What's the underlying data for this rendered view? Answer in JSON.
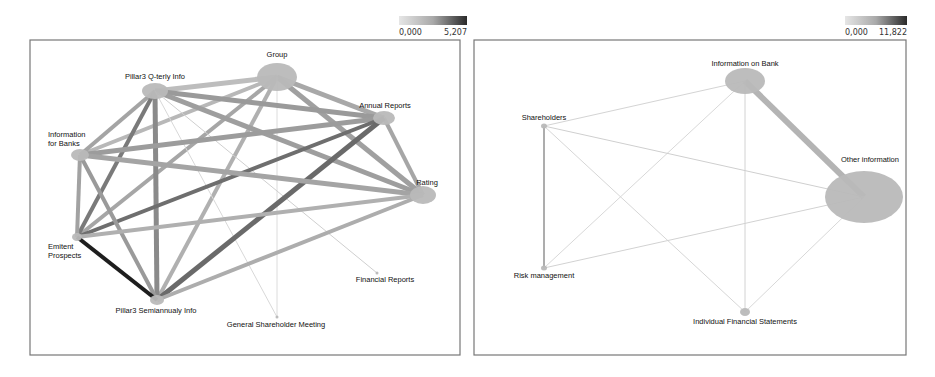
{
  "panels": [
    {
      "id": "left",
      "frame": {
        "x": 30,
        "y": 40,
        "w": 430,
        "h": 315
      },
      "scale": {
        "min_label": "0,000",
        "max_label": "5,207",
        "x": 399,
        "y": 16,
        "w": 68,
        "h": 9
      },
      "nodes": [
        {
          "id": "group",
          "label": "Group",
          "x": 277,
          "y": 77,
          "rx": 20,
          "ry": 14,
          "lx": 277,
          "ly": 57,
          "anchor": "middle"
        },
        {
          "id": "pillar3q",
          "label": "Pillar3 Q-terly Info",
          "x": 155,
          "y": 91,
          "rx": 13,
          "ry": 8,
          "lx": 155,
          "ly": 79,
          "anchor": "middle"
        },
        {
          "id": "annual",
          "label": "Annual Reports",
          "x": 384,
          "y": 118,
          "rx": 11,
          "ry": 7,
          "lx": 385,
          "ly": 108,
          "anchor": "middle"
        },
        {
          "id": "infobanks",
          "label": "Information",
          "label2": "for Banks",
          "x": 80,
          "y": 155,
          "rx": 9,
          "ry": 6,
          "lx": 48,
          "ly": 137,
          "anchor": "start"
        },
        {
          "id": "rating",
          "label": "Rating",
          "x": 423,
          "y": 195,
          "rx": 13,
          "ry": 9,
          "lx": 427,
          "ly": 185,
          "anchor": "middle"
        },
        {
          "id": "emitent",
          "label": "Emitent",
          "label2": "Prospects",
          "x": 77,
          "y": 237,
          "rx": 5,
          "ry": 4,
          "lx": 48,
          "ly": 249,
          "anchor": "start"
        },
        {
          "id": "pillar3s",
          "label": "Pillar3 Semiannualy Info",
          "x": 157,
          "y": 300,
          "rx": 7,
          "ry": 5,
          "lx": 156,
          "ly": 313,
          "anchor": "middle"
        },
        {
          "id": "financial",
          "label": "Financial Reports",
          "x": 377,
          "y": 273,
          "rx": 1.5,
          "ry": 1.5,
          "lx": 385,
          "ly": 282,
          "anchor": "middle"
        },
        {
          "id": "gsm",
          "label": "General Shareholder Meeting",
          "x": 277,
          "y": 317,
          "rx": 1.5,
          "ry": 1.5,
          "lx": 276,
          "ly": 327,
          "anchor": "middle"
        }
      ],
      "edges": [
        {
          "a": "group",
          "b": "pillar3q",
          "w": 5,
          "c": "#bdbdbd"
        },
        {
          "a": "group",
          "b": "annual",
          "w": 5,
          "c": "#a8a8a8"
        },
        {
          "a": "group",
          "b": "rating",
          "w": 5,
          "c": "#a0a0a0"
        },
        {
          "a": "group",
          "b": "infobanks",
          "w": 4,
          "c": "#b8b8b8"
        },
        {
          "a": "group",
          "b": "emitent",
          "w": 4,
          "c": "#a6a6a6"
        },
        {
          "a": "group",
          "b": "pillar3s",
          "w": 4,
          "c": "#b0b0b0"
        },
        {
          "a": "group",
          "b": "gsm",
          "w": 1,
          "c": "#dcdcdc"
        },
        {
          "a": "pillar3q",
          "b": "annual",
          "w": 5,
          "c": "#9a9a9a"
        },
        {
          "a": "pillar3q",
          "b": "rating",
          "w": 5,
          "c": "#9e9e9e"
        },
        {
          "a": "pillar3q",
          "b": "infobanks",
          "w": 4,
          "c": "#a4a4a4"
        },
        {
          "a": "pillar3q",
          "b": "emitent",
          "w": 4,
          "c": "#7a7a7a"
        },
        {
          "a": "pillar3q",
          "b": "pillar3s",
          "w": 5,
          "c": "#8a8a8a"
        },
        {
          "a": "pillar3q",
          "b": "financial",
          "w": 1,
          "c": "#cfcfcf"
        },
        {
          "a": "pillar3q",
          "b": "gsm",
          "w": 1,
          "c": "#d8d8d8"
        },
        {
          "a": "annual",
          "b": "rating",
          "w": 4,
          "c": "#a6a6a6"
        },
        {
          "a": "annual",
          "b": "infobanks",
          "w": 5,
          "c": "#9c9c9c"
        },
        {
          "a": "annual",
          "b": "emitent",
          "w": 4,
          "c": "#6e6e6e"
        },
        {
          "a": "annual",
          "b": "pillar3s",
          "w": 5,
          "c": "#6a6a6a"
        },
        {
          "a": "infobanks",
          "b": "rating",
          "w": 5,
          "c": "#a4a4a4"
        },
        {
          "a": "infobanks",
          "b": "emitent",
          "w": 4,
          "c": "#a2a2a2"
        },
        {
          "a": "infobanks",
          "b": "pillar3s",
          "w": 4,
          "c": "#9a9a9a"
        },
        {
          "a": "rating",
          "b": "emitent",
          "w": 4,
          "c": "#b0b0b0"
        },
        {
          "a": "rating",
          "b": "pillar3s",
          "w": 4,
          "c": "#adadad"
        },
        {
          "a": "emitent",
          "b": "pillar3s",
          "w": 4,
          "c": "#1e1e1e"
        }
      ]
    },
    {
      "id": "right",
      "frame": {
        "x": 474,
        "y": 40,
        "w": 432,
        "h": 315
      },
      "scale": {
        "min_label": "0,000",
        "max_label": "11,822",
        "x": 845,
        "y": 16,
        "w": 62,
        "h": 9
      },
      "nodes": [
        {
          "id": "infobank",
          "label": "Information on Bank",
          "x": 745,
          "y": 81,
          "rx": 20,
          "ry": 13,
          "lx": 745,
          "ly": 66,
          "anchor": "middle"
        },
        {
          "id": "shareholders",
          "label": "Shareholders",
          "x": 544,
          "y": 126,
          "rx": 3,
          "ry": 2.5,
          "lx": 544,
          "ly": 120,
          "anchor": "middle"
        },
        {
          "id": "other",
          "label": "Other information",
          "x": 864,
          "y": 197,
          "rx": 39,
          "ry": 26,
          "lx": 870,
          "ly": 162,
          "anchor": "middle"
        },
        {
          "id": "risk",
          "label": "Risk management",
          "x": 544,
          "y": 268,
          "rx": 3,
          "ry": 2.5,
          "lx": 544,
          "ly": 278,
          "anchor": "middle"
        },
        {
          "id": "ifs",
          "label": "Individual Financial Statements",
          "x": 745,
          "y": 312,
          "rx": 5,
          "ry": 4,
          "lx": 745,
          "ly": 324,
          "anchor": "middle"
        }
      ],
      "edges": [
        {
          "a": "infobank",
          "b": "other",
          "w": 6,
          "c": "#b4b4b4"
        },
        {
          "a": "shareholders",
          "b": "risk",
          "w": 1.4,
          "c": "#8a8a8a"
        },
        {
          "a": "infobank",
          "b": "shareholders",
          "w": 1,
          "c": "#d4d4d4"
        },
        {
          "a": "infobank",
          "b": "risk",
          "w": 1,
          "c": "#d8d8d8"
        },
        {
          "a": "infobank",
          "b": "ifs",
          "w": 1,
          "c": "#d2d2d2"
        },
        {
          "a": "shareholders",
          "b": "other",
          "w": 1,
          "c": "#cfcfcf"
        },
        {
          "a": "shareholders",
          "b": "ifs",
          "w": 1,
          "c": "#d6d6d6"
        },
        {
          "a": "risk",
          "b": "other",
          "w": 1,
          "c": "#d2d2d2"
        },
        {
          "a": "other",
          "b": "ifs",
          "w": 1,
          "c": "#d8d8d8"
        }
      ]
    }
  ],
  "colors": {
    "node_fill": "#b9b9b9",
    "frame": "#777777",
    "scale_light": "#e6e6e6",
    "scale_dark": "#2a2a2a",
    "label": "#111111"
  }
}
